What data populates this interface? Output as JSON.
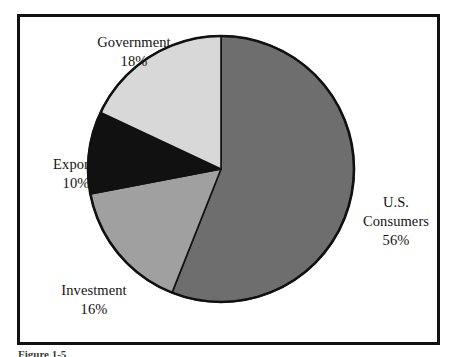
{
  "figure": {
    "frame_border_color": "#111111",
    "background_color": "#ffffff",
    "caption": "Figure 1-5"
  },
  "labels": {
    "government": {
      "name": "Government",
      "percent": "18%"
    },
    "exports": {
      "name": "Exports",
      "percent": "10%"
    },
    "investment": {
      "name": "Investment",
      "percent": "16%"
    },
    "consumers": {
      "name_line1": "U.S.",
      "name_line2": "Consumers",
      "percent": "56%"
    }
  },
  "chart_data": {
    "type": "pie",
    "title": "",
    "subtitle": "",
    "xlabel": "",
    "ylabel": "",
    "grid": false,
    "legend_position": "none",
    "label_style": "outside-callout",
    "start_angle_deg": 0,
    "direction": "clockwise",
    "units": "percent",
    "total": 100,
    "categories": [
      "U.S. Consumers",
      "Investment",
      "Exports",
      "Government"
    ],
    "values": [
      56,
      16,
      10,
      18
    ],
    "value_labels": [
      "56%",
      "16%",
      "10%",
      "18%"
    ],
    "colors": [
      "#6e6e6e",
      "#a0a0a0",
      "#111111",
      "#d8d8d8"
    ],
    "slices": [
      {
        "label": "U.S. Consumers",
        "value": 56,
        "value_label": "56%",
        "color": "#6e6e6e",
        "start_deg": 0,
        "end_deg": 201.6
      },
      {
        "label": "Investment",
        "value": 16,
        "value_label": "16%",
        "color": "#a0a0a0",
        "start_deg": 201.6,
        "end_deg": 259.2
      },
      {
        "label": "Exports",
        "value": 10,
        "value_label": "10%",
        "color": "#111111",
        "start_deg": 259.2,
        "end_deg": 295.2
      },
      {
        "label": "Government",
        "value": 18,
        "value_label": "18%",
        "color": "#d8d8d8",
        "start_deg": 295.2,
        "end_deg": 360.0
      }
    ]
  }
}
